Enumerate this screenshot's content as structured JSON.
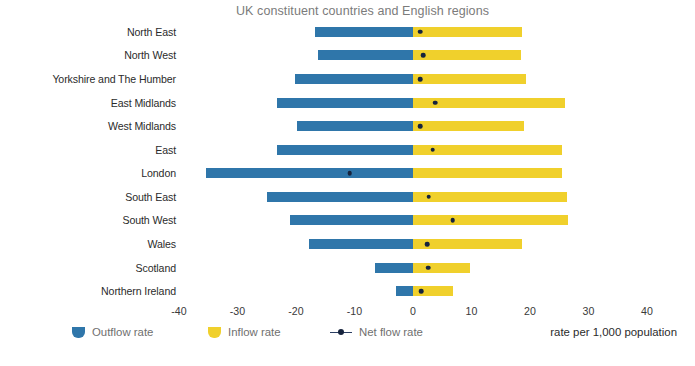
{
  "chart_data": {
    "type": "bar",
    "orientation": "horizontal",
    "subtype": "diverging-bar-with-marker",
    "title": "UK constituent countries and English regions",
    "xlabel": "rate per 1,000 population",
    "ylabel": "",
    "xlim": [
      -40,
      40
    ],
    "xticks": [
      -40,
      -30,
      -20,
      -10,
      0,
      10,
      20,
      30,
      40
    ],
    "xtick_labels": [
      "-40",
      "-30",
      "-20",
      "-10",
      "0",
      "10",
      "20",
      "30",
      "40"
    ],
    "grid": false,
    "legend_position": "bottom-left",
    "categories": [
      "North East",
      "North West",
      "Yorkshire and The Humber",
      "East Midlands",
      "West Midlands",
      "East",
      "London",
      "South East",
      "South West",
      "Wales",
      "Scotland",
      "Northern Ireland"
    ],
    "series": [
      {
        "name": "Outflow rate",
        "color": "#2f76aa",
        "values": [
          -16.8,
          -16.2,
          -20.2,
          -23.2,
          -19.8,
          -23.3,
          -35.4,
          -25.0,
          -21.0,
          -17.8,
          -6.5,
          -2.9
        ]
      },
      {
        "name": "Inflow rate",
        "color": "#f0d02c",
        "values": [
          18.6,
          18.4,
          19.4,
          26.0,
          19.0,
          25.5,
          25.5,
          26.3,
          26.5,
          18.6,
          9.8,
          6.8
        ]
      },
      {
        "name": "Net flow rate",
        "color": "#16233d",
        "marker": "dot",
        "values": [
          1.2,
          1.7,
          1.2,
          3.8,
          1.2,
          3.4,
          -10.8,
          2.7,
          6.8,
          2.4,
          2.6,
          1.4
        ]
      }
    ]
  },
  "legend": {
    "items": [
      {
        "label": "Outflow rate",
        "icon": "outflow-swatch"
      },
      {
        "label": "Inflow rate",
        "icon": "inflow-swatch"
      },
      {
        "label": "Net flow rate",
        "icon": "net-flow-marker"
      }
    ]
  },
  "axis_note": "rate per 1,000 population"
}
